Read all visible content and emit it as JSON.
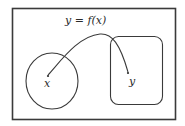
{
  "diagram": {
    "type": "function-mapping",
    "function_label": "y = f(x)",
    "domain_set": {
      "shape": "ellipse",
      "element_label": "x"
    },
    "codomain_set": {
      "shape": "rounded-rectangle",
      "element_label": "y"
    },
    "colors": {
      "stroke": "#3a3a3a",
      "background": "#ffffff",
      "text": "#2a2a2a"
    }
  }
}
